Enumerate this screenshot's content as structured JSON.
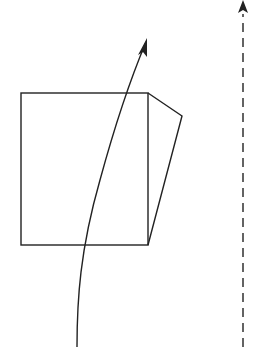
{
  "diagram": {
    "stroke_color": "#222222",
    "background": "#ffffff",
    "elements": [
      {
        "name": "square",
        "type": "rect"
      },
      {
        "name": "side-face",
        "type": "polygon"
      },
      {
        "name": "curved-arrow",
        "type": "curve-with-arrowhead"
      },
      {
        "name": "dashed-arrow",
        "type": "dashed-line-with-arrowhead"
      }
    ]
  }
}
